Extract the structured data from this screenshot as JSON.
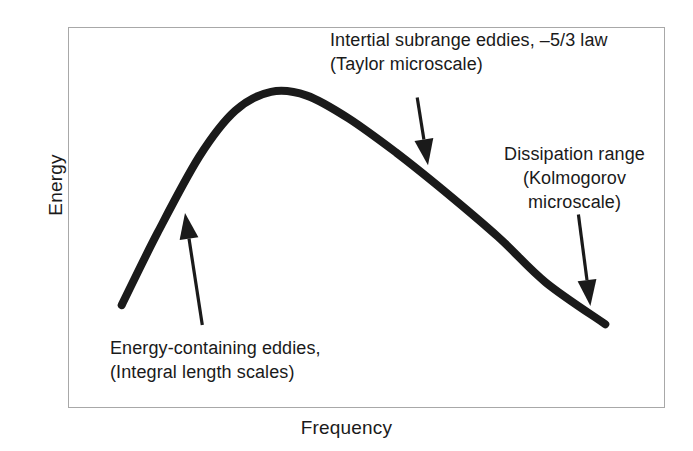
{
  "figure": {
    "type": "turbulence-energy-spectrum-schematic",
    "background_color": "#ffffff",
    "frame_color": "#a8a8a8",
    "curve_color": "#1a1a1a",
    "text_color": "#1a1a1a"
  },
  "axes": {
    "y_label": "Energy",
    "x_label": "Frequency"
  },
  "annotations": {
    "inertial": {
      "line1": "Intertial subrange eddies, –5/3 law",
      "line2": "(Taylor microscale)"
    },
    "dissipation": {
      "line1": "Dissipation range",
      "line2": "(Kolmogorov",
      "line3": "microscale)"
    },
    "energy_containing": {
      "line1": "Energy-containing eddies,",
      "line2": "(Integral length scales)"
    }
  },
  "chart_data": {
    "type": "line",
    "title": "",
    "xlabel": "Frequency",
    "ylabel": "Energy",
    "grid": false,
    "legend": null,
    "axis_ticks": {
      "x": [],
      "y": []
    },
    "axis_ranges": {
      "x": [
        0,
        1
      ],
      "y": [
        0,
        1
      ]
    },
    "series": [
      {
        "name": "Turbulence energy spectrum",
        "comment": "Schematic spectrum: rise to energy-containing peak, -5/3 inertial decay, steeper dissipation fall-off. Values are normalized 0-1 positions read off the plot box.",
        "x": [
          0.09,
          0.15,
          0.22,
          0.28,
          0.34,
          0.4,
          0.47,
          0.55,
          0.63,
          0.72,
          0.8,
          0.9
        ],
        "y": [
          0.27,
          0.46,
          0.66,
          0.78,
          0.83,
          0.82,
          0.76,
          0.67,
          0.57,
          0.45,
          0.33,
          0.22
        ]
      }
    ],
    "arrows": [
      {
        "label": "Energy-containing eddies, (Integral length scales)",
        "from": [
          0.225,
          0.218
        ],
        "to": [
          0.196,
          0.512
        ],
        "direction": "up-left"
      },
      {
        "label": "Intertial subrange eddies, –5/3 law (Taylor microscale)",
        "from": [
          0.585,
          0.815
        ],
        "to": [
          0.603,
          0.637
        ],
        "direction": "down-left"
      },
      {
        "label": "Dissipation range (Kolmogorov microscale)",
        "from": [
          0.855,
          0.508
        ],
        "to": [
          0.875,
          0.268
        ],
        "direction": "down-left"
      }
    ]
  }
}
